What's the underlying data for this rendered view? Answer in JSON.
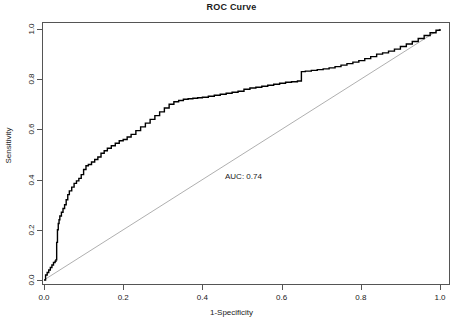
{
  "chart_data": {
    "type": "line",
    "title": "ROC Curve",
    "xlabel": "1-Specificity",
    "ylabel": "Sensitivity",
    "xlim": [
      0,
      1
    ],
    "ylim": [
      0,
      1
    ],
    "grid": false,
    "legend": "none",
    "annotations": [
      {
        "text": "AUC: 0.74",
        "x": 0.46,
        "y": 0.43
      }
    ],
    "xticks": [
      0.0,
      0.2,
      0.4,
      0.6,
      0.8,
      1.0
    ],
    "xtick_labels": [
      "0.0",
      "0.2",
      "0.4",
      "0.6",
      "0.8",
      "1.0"
    ],
    "yticks": [
      0.0,
      0.2,
      0.4,
      0.6,
      0.8,
      1.0
    ],
    "ytick_labels": [
      "0.0",
      "0.2",
      "0.4",
      "0.6",
      "0.8",
      "1.0"
    ],
    "series": [
      {
        "name": "ROC curve",
        "color": "#000000",
        "style": "step",
        "x": [
          0.0,
          0.004,
          0.008,
          0.012,
          0.016,
          0.02,
          0.024,
          0.028,
          0.03,
          0.032,
          0.034,
          0.036,
          0.038,
          0.04,
          0.044,
          0.048,
          0.052,
          0.056,
          0.06,
          0.064,
          0.07,
          0.076,
          0.082,
          0.088,
          0.094,
          0.1,
          0.106,
          0.112,
          0.12,
          0.128,
          0.136,
          0.144,
          0.152,
          0.16,
          0.17,
          0.18,
          0.19,
          0.2,
          0.21,
          0.22,
          0.232,
          0.244,
          0.256,
          0.268,
          0.28,
          0.292,
          0.304,
          0.316,
          0.328,
          0.34,
          0.352,
          0.364,
          0.376,
          0.388,
          0.4,
          0.415,
          0.43,
          0.445,
          0.46,
          0.475,
          0.49,
          0.505,
          0.52,
          0.535,
          0.55,
          0.565,
          0.58,
          0.595,
          0.61,
          0.625,
          0.64,
          0.65,
          0.66,
          0.675,
          0.69,
          0.705,
          0.72,
          0.735,
          0.75,
          0.765,
          0.78,
          0.795,
          0.81,
          0.825,
          0.84,
          0.855,
          0.87,
          0.885,
          0.9,
          0.915,
          0.93,
          0.945,
          0.96,
          0.975,
          0.99,
          1.0
        ],
        "y": [
          0.0,
          0.02,
          0.03,
          0.04,
          0.05,
          0.06,
          0.07,
          0.075,
          0.08,
          0.15,
          0.2,
          0.225,
          0.24,
          0.255,
          0.27,
          0.285,
          0.3,
          0.32,
          0.34,
          0.355,
          0.37,
          0.385,
          0.395,
          0.405,
          0.42,
          0.44,
          0.455,
          0.46,
          0.47,
          0.48,
          0.49,
          0.505,
          0.515,
          0.525,
          0.535,
          0.545,
          0.555,
          0.56,
          0.57,
          0.58,
          0.595,
          0.61,
          0.625,
          0.64,
          0.655,
          0.67,
          0.685,
          0.7,
          0.71,
          0.715,
          0.72,
          0.722,
          0.724,
          0.726,
          0.728,
          0.732,
          0.736,
          0.74,
          0.744,
          0.748,
          0.752,
          0.76,
          0.765,
          0.768,
          0.772,
          0.776,
          0.78,
          0.784,
          0.788,
          0.79,
          0.793,
          0.83,
          0.832,
          0.835,
          0.838,
          0.841,
          0.845,
          0.85,
          0.856,
          0.862,
          0.868,
          0.874,
          0.882,
          0.89,
          0.9,
          0.905,
          0.912,
          0.92,
          0.93,
          0.94,
          0.95,
          0.962,
          0.974,
          0.985,
          0.995,
          1.0
        ]
      },
      {
        "name": "reference diagonal",
        "color": "#9a9a9a",
        "style": "line",
        "x": [
          0.0,
          1.0
        ],
        "y": [
          0.0,
          1.0
        ]
      }
    ]
  }
}
